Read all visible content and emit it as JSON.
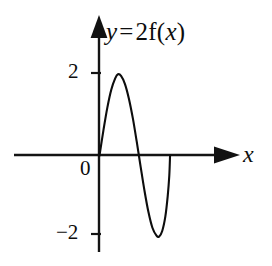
{
  "figure": {
    "background_color": "#ffffff",
    "ink_color": "#0d0d0d",
    "width": 272,
    "height": 266
  },
  "equation": {
    "full_text": "y = 2f(x)",
    "lhs": "y",
    "relation": "=",
    "coefficient": "2",
    "function_name": "f",
    "open_paren": "(",
    "argument": "x",
    "close_paren": ")"
  },
  "axes": {
    "x_axis_name": "x",
    "y_axis_name": "y",
    "origin_label": "0",
    "y_ticks": [
      {
        "label": "2",
        "value": 2
      },
      {
        "label": "−2",
        "value": -2
      }
    ],
    "x_ticks": [],
    "x_arrow": "right-arrow-head",
    "y_arrow": "up-arrow-head"
  },
  "chart_data": {
    "type": "line",
    "xlabel": "x",
    "ylabel": "y",
    "grid": false,
    "legend": "none",
    "xlim": [
      -2.1,
      3.0
    ],
    "ylim": [
      -2.6,
      2.6
    ],
    "yticks": [
      2,
      -2
    ],
    "ytick_labels": [
      "2",
      "−2"
    ],
    "xticks": [],
    "annotations": [
      "0"
    ],
    "series": [
      {
        "name": "y = 2f(x)",
        "color": "#0d0d0d",
        "points": [
          {
            "x": 0.0,
            "y": 0.0
          },
          {
            "x": 0.1,
            "y": 0.62
          },
          {
            "x": 0.2,
            "y": 1.18
          },
          {
            "x": 0.3,
            "y": 1.62
          },
          {
            "x": 0.4,
            "y": 1.9
          },
          {
            "x": 0.47,
            "y": 2.0
          },
          {
            "x": 0.55,
            "y": 1.96
          },
          {
            "x": 0.65,
            "y": 1.76
          },
          {
            "x": 0.75,
            "y": 1.4
          },
          {
            "x": 0.85,
            "y": 0.92
          },
          {
            "x": 0.95,
            "y": 0.34
          },
          {
            "x": 1.05,
            "y": -0.28
          },
          {
            "x": 1.15,
            "y": -0.88
          },
          {
            "x": 1.25,
            "y": -1.4
          },
          {
            "x": 1.35,
            "y": -1.78
          },
          {
            "x": 1.45,
            "y": -1.97
          },
          {
            "x": 1.52,
            "y": -2.0
          },
          {
            "x": 1.6,
            "y": -1.86
          },
          {
            "x": 1.68,
            "y": -1.5
          },
          {
            "x": 1.74,
            "y": -1.0
          },
          {
            "x": 1.78,
            "y": -0.5
          },
          {
            "x": 1.8,
            "y": 0.0
          }
        ],
        "maximum": {
          "x": 0.47,
          "y": 2
        },
        "minimum": {
          "x": 1.52,
          "y": -2
        },
        "zeros": [
          0.0,
          1.0,
          1.8
        ]
      }
    ]
  }
}
